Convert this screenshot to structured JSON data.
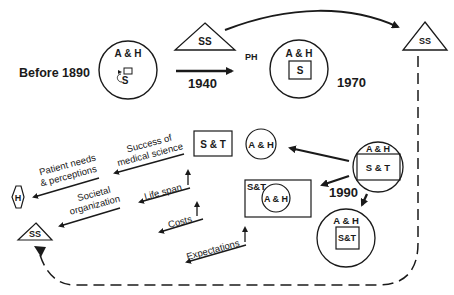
{
  "diagram": {
    "colors": {
      "ink": "#1a1a1a",
      "background": "#ffffff"
    },
    "top": {
      "before_label": "Before 1890",
      "circle1": {
        "outer": "A & H",
        "inner": "S"
      },
      "ss_triangle_left": "SS",
      "year_1940": "1940",
      "ph_label": "PH",
      "circle2": {
        "outer": "A & H",
        "inner": "S"
      },
      "year_1970": "1970",
      "ss_triangle_right": "SS"
    },
    "middle": {
      "st_box": "S & T",
      "ah_circle": "A & H",
      "circle3": {
        "outer": "A & H",
        "inner": "S & T"
      },
      "rect_box": {
        "corner": "S&T",
        "inner": "A & H"
      },
      "year_1990": "1990",
      "circle4": {
        "outer": "A & H",
        "inner": "S&T"
      }
    },
    "left": {
      "h_hexagon": "H",
      "ss_triangle": "SS",
      "labels": {
        "success1": "Success of",
        "success2": "medical science",
        "patient1": "Patient needs",
        "patient2": "& perceptions",
        "societal1": "Societal",
        "societal2": "organization",
        "life_span": "Life span",
        "costs": "Costs",
        "expectations": "Expectations"
      }
    }
  }
}
